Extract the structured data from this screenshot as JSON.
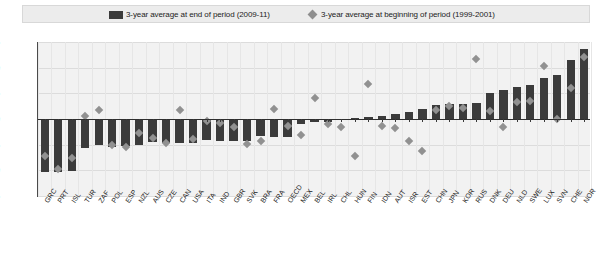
{
  "legend": {
    "bars_label": "3-year average at end of period (2009-11)",
    "markers_label": "3-year average at beginning of period (1999-2001)",
    "bars_color": "#3b3b3b",
    "markers_color": "#8e8e8e"
  },
  "axis": {
    "y_ticks": [
      "15",
      "10",
      "5",
      "0",
      "-5",
      "-10",
      "-15"
    ]
  },
  "chart_data": {
    "type": "bar",
    "title": "",
    "subtitle": "",
    "xlabel": "",
    "ylabel": "",
    "ylim": [
      -15,
      15
    ],
    "y_ticks": [
      15,
      10,
      5,
      0,
      -5,
      -10,
      -15
    ],
    "grid": true,
    "legend_position": "top",
    "categories": [
      "GRC",
      "PRT",
      "ISL",
      "TUR",
      "ZAF",
      "POL",
      "ESP",
      "NZL",
      "AUS",
      "CZE",
      "CAN",
      "USA",
      "ITA",
      "IND",
      "GBR",
      "SVK",
      "BRA",
      "FRA",
      "OECD",
      "MEX",
      "BEL",
      "IRL",
      "CHL",
      "HUN",
      "FIN",
      "IDN",
      "AUT",
      "ISR",
      "EST",
      "CHN",
      "JPN",
      "KOR",
      "RUS",
      "DNK",
      "DEU",
      "NLD",
      "SWE",
      "LUX",
      "SVN",
      "CHE",
      "NOR"
    ],
    "series": [
      {
        "name": "3-year average at end of period (2009-11)",
        "type": "bar",
        "color": "#3b3b3b",
        "values": [
          -10.3,
          -10.4,
          -10.2,
          -5.6,
          -5.0,
          -5.4,
          -5.3,
          -5.0,
          -4.5,
          -4.6,
          -4.6,
          -4.6,
          -4.1,
          -4.3,
          -4.2,
          -4.2,
          -3.4,
          -3.5,
          -3.5,
          -1.0,
          -0.6,
          -0.5,
          -0.2,
          0.2,
          0.4,
          0.6,
          0.9,
          1.3,
          1.9,
          2.7,
          2.9,
          2.9,
          3.2,
          5.0,
          5.6,
          6.3,
          6.7,
          8.0,
          8.5,
          11.5,
          13.6
        ]
      },
      {
        "name": "3-year average at beginning of period (1999-2001)",
        "type": "scatter",
        "color": "#919191",
        "marker": "diamond",
        "values": [
          -7.2,
          -9.8,
          -7.5,
          0.5,
          1.8,
          -5.0,
          -5.4,
          -2.7,
          -3.7,
          -4.6,
          1.8,
          -3.9,
          -0.3,
          -0.8,
          -1.5,
          -4.8,
          -4.2,
          2.0,
          -1.3,
          -3.1,
          4.0,
          -0.9,
          -1.5,
          -7.3,
          6.9,
          -1.3,
          -1.8,
          -4.2,
          -6.3,
          1.8,
          2.5,
          2.2,
          11.6,
          1.6,
          -1.6,
          3.3,
          3.6,
          10.3,
          0.0,
          6.1,
          12.1
        ]
      }
    ]
  }
}
